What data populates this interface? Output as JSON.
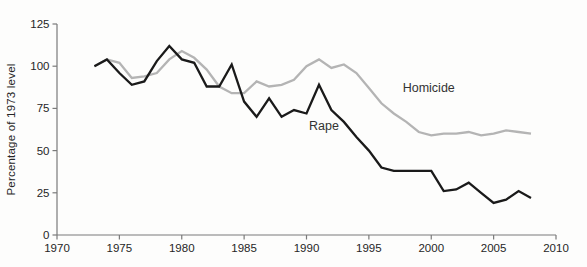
{
  "figure": {
    "background": "#fdfdfc",
    "axis_color": "#7a7a7a",
    "text_color": "#262626"
  },
  "chart_data": {
    "type": "line",
    "title": "",
    "xlabel": "",
    "ylabel": "Percentage of 1973 level",
    "xlim": [
      1970,
      2010
    ],
    "ylim": [
      0,
      125
    ],
    "x_ticks": [
      1970,
      1975,
      1980,
      1985,
      1990,
      1995,
      2000,
      2005,
      2010
    ],
    "y_ticks": [
      0,
      25,
      50,
      75,
      100,
      125
    ],
    "grid": false,
    "legend_position": "inline-annotations",
    "x": [
      1973,
      1974,
      1975,
      1976,
      1977,
      1978,
      1979,
      1980,
      1981,
      1982,
      1983,
      1984,
      1985,
      1986,
      1987,
      1988,
      1989,
      1990,
      1991,
      1992,
      1993,
      1994,
      1995,
      1996,
      1997,
      1998,
      1999,
      2000,
      2001,
      2002,
      2003,
      2004,
      2005,
      2006,
      2007,
      2008
    ],
    "series": [
      {
        "name": "Homicide",
        "color": "#b4b4b4",
        "label_x": 1999.8,
        "label_y": 87,
        "values": [
          100,
          104,
          102,
          93,
          94,
          96,
          104,
          109,
          105,
          98,
          88,
          84,
          84,
          91,
          88,
          89,
          92,
          100,
          104,
          99,
          101,
          96,
          87,
          78,
          72,
          67,
          61,
          59,
          60,
          60,
          61,
          59,
          60,
          62,
          61,
          60
        ]
      },
      {
        "name": "Rape",
        "color": "#1a1a1a",
        "label_x": 1991.4,
        "label_y": 64.5,
        "values": [
          100,
          104,
          96,
          89,
          91,
          103,
          112,
          104,
          102,
          88,
          88,
          101,
          79,
          70,
          81,
          70,
          74,
          72,
          89,
          74,
          67,
          58,
          50,
          40,
          38,
          38,
          38,
          38,
          26,
          27,
          31,
          25,
          19,
          21,
          26,
          22
        ]
      }
    ]
  }
}
